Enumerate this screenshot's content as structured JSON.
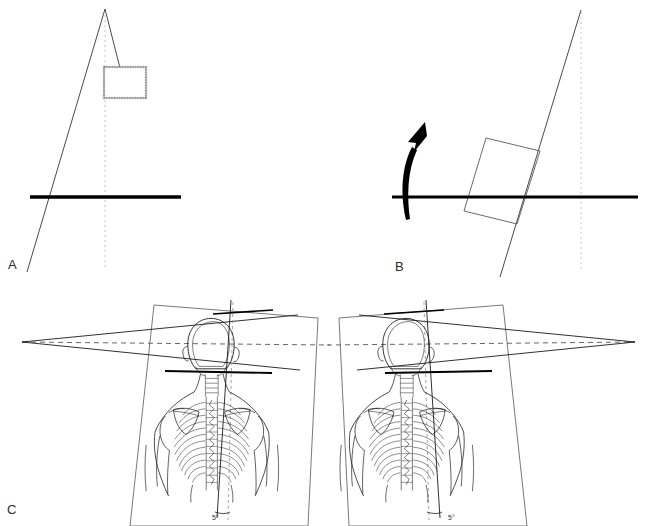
{
  "figure": {
    "background_color": "#ffffff",
    "ink_color": "#1a1a1a",
    "dotted_color": "#b9b9b9",
    "dashed_color": "#555555",
    "width": 657,
    "height": 526
  },
  "panels": [
    {
      "id": "A",
      "label": "A",
      "name": "panel-a-untilted-reference",
      "elements": {
        "oblique_line_name": "oblique-reference-line",
        "vertical_dotted_name": "vertical-plumb-dotted-line",
        "horizontal_bold_name": "horizontal-reference-bar",
        "short_connector_name": "apex-to-box-connector",
        "box_name": "dotted-reference-box"
      }
    },
    {
      "id": "B",
      "label": "B",
      "name": "panel-b-tilted-rotation",
      "elements": {
        "oblique_line_name": "tilted-reference-line",
        "vertical_dotted_name": "vertical-plumb-dotted-line",
        "horizontal_bold_name": "horizontal-reference-bar",
        "box_name": "tilted-box",
        "arrow_name": "rotation-arrow"
      }
    },
    {
      "id": "C",
      "label": "C",
      "name": "panel-c-skeleton-pair",
      "figures": [
        {
          "name": "skeleton-figure-left",
          "vertex_side": "left",
          "angle_label": "5°",
          "angle_label_name": "angle-label-left"
        },
        {
          "name": "skeleton-figure-right",
          "vertex_side": "right",
          "angle_label": "5°",
          "angle_label_name": "angle-label-right"
        }
      ]
    }
  ],
  "annotations": {
    "angle_value_left": "5°",
    "angle_value_right": "5°"
  }
}
